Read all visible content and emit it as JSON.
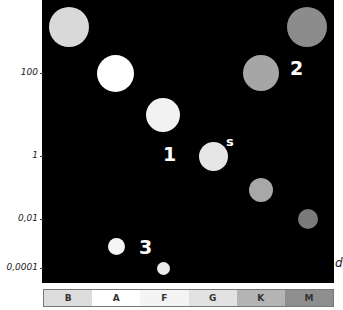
{
  "y_axis": {
    "ticks": [
      {
        "label": "100"
      },
      {
        "label": "1"
      },
      {
        "label": "0,01"
      },
      {
        "label": "0,0001"
      }
    ]
  },
  "x_axis_end_label": "d",
  "annotations": {
    "group1": "1",
    "group2": "2",
    "group3": "3",
    "sun": "s"
  },
  "stars": [
    {
      "id": "B-giant",
      "color": "#d9d9d9"
    },
    {
      "id": "A-main",
      "color": "#ffffff"
    },
    {
      "id": "F-main",
      "color": "#f2f2f2"
    },
    {
      "id": "G-sun",
      "color": "#e6e6e6"
    },
    {
      "id": "K-main",
      "color": "#a8a8a8"
    },
    {
      "id": "M-main",
      "color": "#7a7a7a"
    },
    {
      "id": "M-giant",
      "color": "#8c8c8c"
    },
    {
      "id": "K-giant",
      "color": "#a6a6a6"
    },
    {
      "id": "A-dwarf",
      "color": "#f5f5f5"
    },
    {
      "id": "F-dwarf",
      "color": "#ececec"
    }
  ],
  "spectral_classes": [
    {
      "label": "B",
      "color": "#dcdcdc"
    },
    {
      "label": "A",
      "color": "#ffffff"
    },
    {
      "label": "F",
      "color": "#f4f4f4"
    },
    {
      "label": "G",
      "color": "#e2e2e2"
    },
    {
      "label": "K",
      "color": "#b4b4b4"
    },
    {
      "label": "M",
      "color": "#8e8e8e"
    }
  ]
}
